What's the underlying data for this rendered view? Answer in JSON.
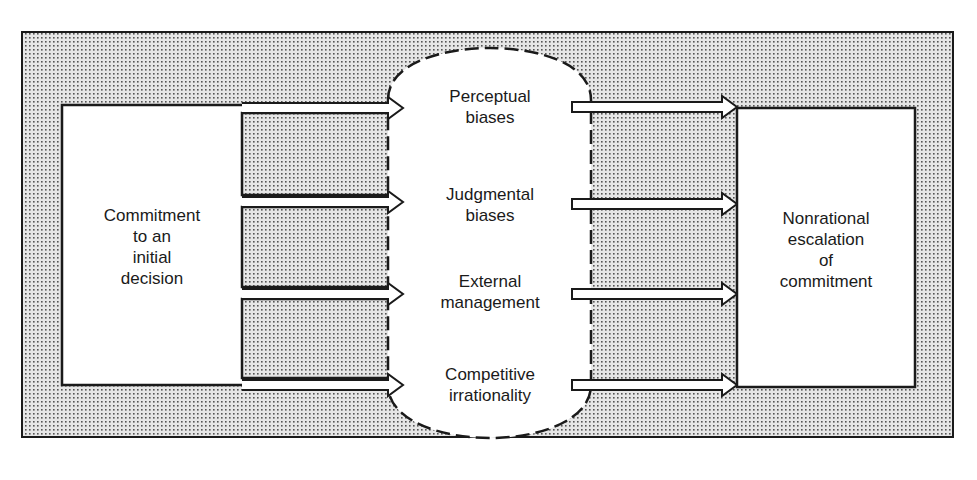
{
  "diagram": {
    "source": {
      "label_lines": [
        "Commitment",
        "to an",
        "initial",
        "decision"
      ]
    },
    "factors": [
      {
        "id": "perceptual",
        "label_lines": [
          "Perceptual",
          "biases"
        ]
      },
      {
        "id": "judgmental",
        "label_lines": [
          "Judgmental",
          "biases"
        ]
      },
      {
        "id": "external",
        "label_lines": [
          "External",
          "management"
        ]
      },
      {
        "id": "competitive",
        "label_lines": [
          "Competitive",
          "irrationality"
        ]
      }
    ],
    "outcome": {
      "label_lines": [
        "Nonrational",
        "escalation",
        "of",
        "commitment"
      ]
    },
    "colors": {
      "ink": "#1a1a1a",
      "stipple_bg": "#e4e4e4",
      "stipple_dot": "#4a4a4a",
      "paper": "#ffffff"
    }
  }
}
